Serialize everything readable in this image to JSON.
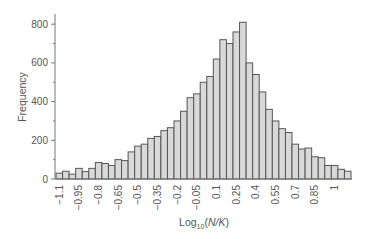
{
  "chart_data": {
    "type": "bar",
    "subtype": "histogram",
    "title": "",
    "xlabel": "Log10(N/K)",
    "xlabel_parts": {
      "base": "Log",
      "sub": "10",
      "paren_open": "(",
      "var": "N/K",
      "paren_close": ")"
    },
    "ylabel": "Frequency",
    "ylim": [
      0,
      850
    ],
    "yticks": [
      0,
      200,
      400,
      600,
      800
    ],
    "yminor_ticks": [
      100,
      300,
      500,
      700
    ],
    "xtick_labels": [
      "−1.1",
      "−0.95",
      "−0.8",
      "−0.65",
      "−0.5",
      "−0.35",
      "−0.2",
      "−0.05",
      "0.1",
      "0.25",
      "0.4",
      "0.55",
      "0.7",
      "0.85",
      "1"
    ],
    "bin_width": 0.05,
    "bin_start": -1.125,
    "grid": false,
    "legend": null,
    "bar_fill": "#d9d9d9",
    "bar_edge": "#555555",
    "values": [
      30,
      40,
      25,
      55,
      38,
      55,
      85,
      80,
      70,
      100,
      95,
      140,
      170,
      180,
      210,
      220,
      250,
      265,
      300,
      350,
      420,
      440,
      500,
      530,
      620,
      720,
      700,
      760,
      810,
      600,
      540,
      450,
      360,
      300,
      260,
      240,
      180,
      155,
      160,
      115,
      110,
      70,
      70,
      50,
      40
    ]
  }
}
